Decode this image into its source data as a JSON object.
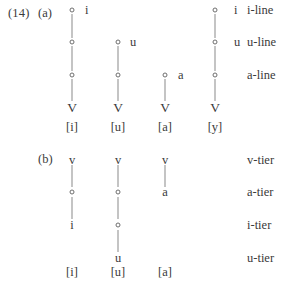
{
  "example": {
    "number": "(14)",
    "parts": [
      {
        "id": "a",
        "label": "(a)"
      },
      {
        "id": "b",
        "label": "(b)"
      }
    ]
  },
  "part_a": {
    "tiers": [
      {
        "name": "i-line",
        "y": 10
      },
      {
        "name": "u-line",
        "y": 42
      },
      {
        "name": "a-line",
        "y": 75
      },
      {
        "name": "",
        "y": 108
      }
    ],
    "melody_labels": [
      {
        "text": "i",
        "x": 85,
        "y": 10
      },
      {
        "text": "u",
        "x": 130,
        "y": 42
      },
      {
        "text": "a",
        "x": 178,
        "y": 75
      },
      {
        "text": "i",
        "x": 234,
        "y": 10
      },
      {
        "text": "u",
        "x": 234,
        "y": 42
      }
    ],
    "columns": [
      {
        "id": "col-a-1",
        "x": 72,
        "root": "V",
        "surface": "[i]",
        "nodes_y": [
          10,
          42,
          75
        ],
        "lines": [
          {
            "top": 14,
            "height": 24
          },
          {
            "top": 46,
            "height": 25
          },
          {
            "top": 79,
            "height": 22
          }
        ]
      },
      {
        "id": "col-a-2",
        "x": 118,
        "root": "V",
        "surface": "[u]",
        "nodes_y": [
          42,
          75
        ],
        "lines": [
          {
            "top": 46,
            "height": 25
          },
          {
            "top": 79,
            "height": 22
          }
        ]
      },
      {
        "id": "col-a-3",
        "x": 165,
        "root": "V",
        "surface": "[a]",
        "nodes_y": [
          75
        ],
        "lines": [
          {
            "top": 79,
            "height": 22
          }
        ]
      },
      {
        "id": "col-a-4",
        "x": 215,
        "root": "V",
        "surface": "[y]",
        "nodes_y": [
          10,
          42,
          75
        ],
        "lines": [
          {
            "top": 14,
            "height": 24
          },
          {
            "top": 46,
            "height": 25
          },
          {
            "top": 79,
            "height": 22
          }
        ]
      }
    ],
    "root_y": 108,
    "surface_y": 127
  },
  "part_b": {
    "tiers": [
      {
        "name": "v-tier",
        "y": 160
      },
      {
        "name": "a-tier",
        "y": 192
      },
      {
        "name": "i-tier",
        "y": 225
      },
      {
        "name": "u-tier",
        "y": 258
      }
    ],
    "columns": [
      {
        "id": "col-b-1",
        "x": 72,
        "surface": "[i]",
        "symbols": [
          {
            "text": "v",
            "y": 160
          },
          {
            "text": "i",
            "y": 225
          }
        ],
        "nodes_y": [
          192
        ],
        "lines": [
          {
            "top": 165,
            "height": 22
          },
          {
            "top": 197,
            "height": 22
          }
        ]
      },
      {
        "id": "col-b-2",
        "x": 118,
        "surface": "[u]",
        "symbols": [
          {
            "text": "v",
            "y": 160
          },
          {
            "text": "u",
            "y": 258
          }
        ],
        "nodes_y": [
          192,
          225
        ],
        "lines": [
          {
            "top": 165,
            "height": 22
          },
          {
            "top": 197,
            "height": 22
          },
          {
            "top": 230,
            "height": 22
          }
        ]
      },
      {
        "id": "col-b-3",
        "x": 165,
        "surface": "[a]",
        "symbols": [
          {
            "text": "v",
            "y": 160
          },
          {
            "text": "a",
            "y": 192
          }
        ],
        "nodes_y": [],
        "lines": [
          {
            "top": 165,
            "height": 22
          }
        ]
      }
    ],
    "surface_y": 272
  },
  "colors": {
    "text": "#3a3a3a",
    "line": "#8a8a8a",
    "node_stroke": "#6e6e6e",
    "background": "#ffffff"
  }
}
